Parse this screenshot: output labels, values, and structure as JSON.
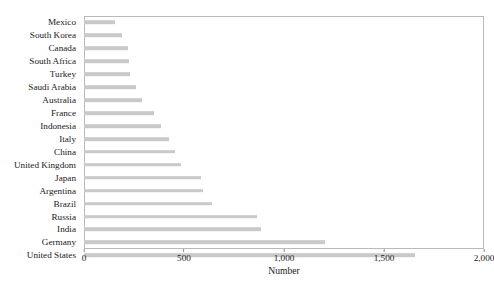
{
  "chart_data": {
    "type": "bar",
    "orientation": "horizontal",
    "title": "",
    "xlabel": "Number",
    "ylabel": "",
    "xlim": [
      0,
      2000
    ],
    "grid": false,
    "legend": null,
    "bar_color": "#c9c9c9",
    "frame_color": "#b9b9b9",
    "xticks": [
      0,
      500,
      1000,
      1500,
      2000
    ],
    "xtick_labels": [
      "0",
      "500",
      "1,000",
      "1,500",
      "2,000"
    ],
    "categories": [
      "Mexico",
      "South Korea",
      "Canada",
      "South Africa",
      "Turkey",
      "Saudi Arabia",
      "Australia",
      "France",
      "Indonesia",
      "Italy",
      "China",
      "United Kingdom",
      "Japan",
      "Argentina",
      "Brazil",
      "Russia",
      "India",
      "Germany",
      "United States"
    ],
    "values": [
      155,
      190,
      220,
      225,
      230,
      260,
      290,
      350,
      385,
      425,
      455,
      485,
      585,
      595,
      640,
      865,
      885,
      1205,
      1655
    ]
  }
}
